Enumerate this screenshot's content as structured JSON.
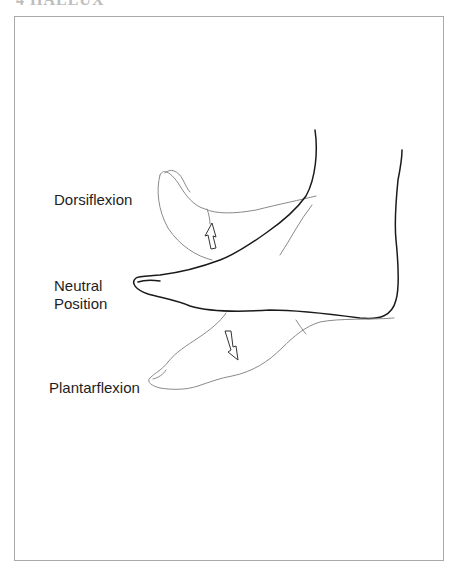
{
  "page": {
    "header_fragment": "4  HALLUX"
  },
  "figure": {
    "labels": {
      "dorsiflexion": "Dorsiflexion",
      "neutral_line1": "Neutral",
      "neutral_line2": "Position",
      "plantarflexion": "Plantarflexion"
    },
    "arrows": {
      "dorsiflexion": "arrow-up-icon",
      "plantarflexion": "arrow-down-icon"
    },
    "colors": {
      "neutral_outline": "#1a1a1a",
      "flexion_outline": "#8a8a8a",
      "frame_border": "#a9a9a9",
      "label_text": "#1e1e1e"
    }
  }
}
